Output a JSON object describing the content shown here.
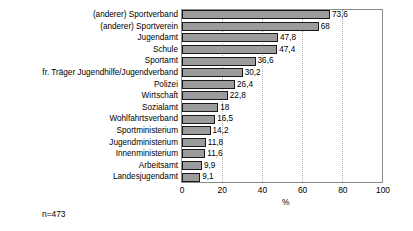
{
  "chart_data": {
    "type": "bar",
    "orientation": "horizontal",
    "title": "",
    "xlabel": "%",
    "ylabel": "",
    "xlim": [
      0,
      100
    ],
    "xticks": [
      "0",
      "20",
      "40",
      "60",
      "80",
      "100"
    ],
    "grid": "vertical-dotted",
    "legend": "none",
    "annotation": "n=473",
    "categories": [
      "(anderer) Sportverband",
      "(anderer) Sportverein",
      "Jugendamt",
      "Schule",
      "Sportamt",
      "fr. Träger Jugendhilfe/Jugendverband",
      "Polizei",
      "Wirtschaft",
      "Sozialamt",
      "Wohlfahrtsverband",
      "Sportministerium",
      "Jugendministerium",
      "Innenministerium",
      "Arbeitsamt",
      "Landesjugendamt"
    ],
    "values": [
      73.6,
      68,
      47.8,
      47.4,
      36.6,
      30.2,
      26.4,
      22.8,
      18,
      16.5,
      14.2,
      11.8,
      11.6,
      9.9,
      9.1
    ],
    "value_labels": [
      "73,6",
      "68",
      "47,8",
      "47,4",
      "36,6",
      "30,2",
      "26,4",
      "22,8",
      "18",
      "16,5",
      "14,2",
      "11,8",
      "11,6",
      "9,9",
      "9,1"
    ]
  },
  "style": {
    "bar_fill": "#9c9c9c",
    "bar_border": "#1a1a1a",
    "frame": "#8a8a8a",
    "gridline": "#aaaaaa",
    "text": "#000000",
    "background": "#ffffff"
  }
}
